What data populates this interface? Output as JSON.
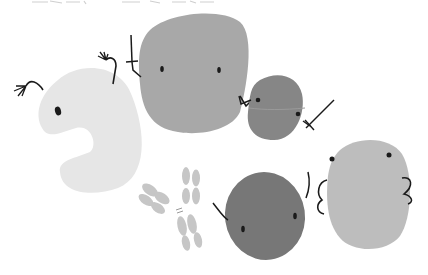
{
  "caption": {
    "left_fragment": "",
    "right_fragment": ""
  },
  "characters": [
    {
      "id": "pale-crescent-blob",
      "color": "#e6e6e6",
      "eyes": 1,
      "arms": "two raised hands at top"
    },
    {
      "id": "large-gray-blob",
      "color": "#a8a8a8",
      "eyes": 2,
      "holds": "sword"
    },
    {
      "id": "small-dark-blob",
      "color": "#8a8a8a",
      "eyes": 2,
      "holds": "sword"
    },
    {
      "id": "antibody",
      "color": "#c4c4c4",
      "shape": "Y"
    },
    {
      "id": "dark-round-blob",
      "color": "#7a7a7a",
      "eyes": 2
    },
    {
      "id": "light-oval-blob",
      "color": "#bcbcbc",
      "eyes": 2,
      "arms": "hands on hips"
    }
  ],
  "colors": {
    "background": "#ffffff",
    "outline": "#1a1a1a",
    "pale": "#e6e6e6",
    "mid": "#a8a8a8",
    "dark": "#858585",
    "darker": "#777777",
    "light": "#bdbdbd",
    "antibody": "#c6c6c6"
  }
}
